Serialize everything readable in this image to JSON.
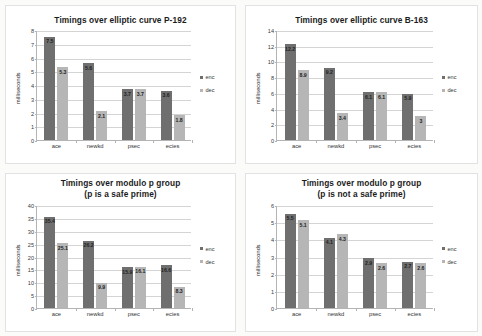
{
  "legend": {
    "enc": "enc",
    "dec": "dec",
    "position": "right"
  },
  "axis": {
    "ylabel": "milliseconds"
  },
  "chart_data": [
    {
      "id": "p192",
      "type": "bar",
      "title": "Timings over elliptic curve P-192",
      "title_lines": [
        "Timings over elliptic curve P-192"
      ],
      "categories": [
        "ace",
        "newkd",
        "psec",
        "ecies"
      ],
      "series": [
        {
          "name": "enc",
          "values": [
            7.5,
            5.6,
            3.7,
            3.6
          ],
          "color": "#6f6f6f"
        },
        {
          "name": "dec",
          "values": [
            5.3,
            2.1,
            3.7,
            1.8
          ],
          "color": "#b6b6b6"
        }
      ],
      "xlabel": "",
      "ylabel": "milliseconds",
      "ylim": [
        0,
        8
      ],
      "yticks": [
        0,
        1,
        2,
        3,
        4,
        5,
        6,
        7,
        8
      ],
      "grid": true
    },
    {
      "id": "b163",
      "type": "bar",
      "title": "Timings over elliptic curve B-163",
      "title_lines": [
        "Timings over elliptic curve B-163"
      ],
      "categories": [
        "ace",
        "newkd",
        "psec",
        "ecies"
      ],
      "series": [
        {
          "name": "enc",
          "values": [
            12.2,
            9.2,
            6.1,
            5.9
          ],
          "color": "#6f6f6f"
        },
        {
          "name": "dec",
          "values": [
            8.9,
            3.4,
            6.1,
            3
          ],
          "color": "#b6b6b6"
        }
      ],
      "xlabel": "",
      "ylabel": "milliseconds",
      "ylim": [
        0,
        14
      ],
      "yticks": [
        0,
        2,
        4,
        6,
        8,
        10,
        12,
        14
      ],
      "grid": true
    },
    {
      "id": "modp-safe",
      "type": "bar",
      "title": "Timings over modulo p group (p is a safe prime)",
      "title_lines": [
        "Timings over modulo p group",
        "(p is a safe prime)"
      ],
      "categories": [
        "ace",
        "newkd",
        "psec",
        "ecies"
      ],
      "series": [
        {
          "name": "enc",
          "values": [
            35.4,
            26.2,
            15.9,
            16.6
          ],
          "color": "#6f6f6f"
        },
        {
          "name": "dec",
          "values": [
            25.1,
            9.9,
            16.1,
            8.3
          ],
          "color": "#b6b6b6"
        }
      ],
      "xlabel": "",
      "ylabel": "milliseconds",
      "ylim": [
        0,
        40
      ],
      "yticks": [
        0,
        5,
        10,
        15,
        20,
        25,
        30,
        35,
        40
      ],
      "grid": true
    },
    {
      "id": "modp-notsafe",
      "type": "bar",
      "title": "Timings over modulo p group (p is not a safe prime)",
      "title_lines": [
        "Timings over modulo p group",
        "(p is not a safe prime)"
      ],
      "categories": [
        "ace",
        "newkd",
        "psec",
        "ecies"
      ],
      "series": [
        {
          "name": "enc",
          "values": [
            5.5,
            4.1,
            2.9,
            2.7
          ],
          "color": "#6f6f6f"
        },
        {
          "name": "dec",
          "values": [
            5.1,
            4.3,
            2.6,
            2.6
          ],
          "color": "#b6b6b6"
        }
      ],
      "xlabel": "",
      "ylabel": "milliseconds",
      "ylim": [
        0,
        6
      ],
      "yticks": [
        0,
        1,
        2,
        3,
        4,
        5,
        6
      ],
      "grid": true
    }
  ]
}
